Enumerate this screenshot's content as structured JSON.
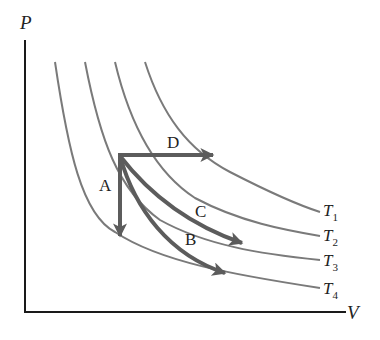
{
  "diagram": {
    "type": "PV-diagram",
    "axes": {
      "y_label": "P",
      "x_label": "V"
    },
    "isotherms": [
      {
        "label": "T",
        "sub": "1"
      },
      {
        "label": "T",
        "sub": "2"
      },
      {
        "label": "T",
        "sub": "3"
      },
      {
        "label": "T",
        "sub": "4"
      }
    ],
    "processes": [
      {
        "label": "A",
        "description": "vertical arrow down (constant volume) from start point to T4 isotherm"
      },
      {
        "label": "B",
        "description": "curved arrow from start point down-right to T4 isotherm"
      },
      {
        "label": "C",
        "description": "curved arrow from start point down-right to T3 isotherm"
      },
      {
        "label": "D",
        "description": "horizontal arrow right (constant pressure) from start point to T1 isotherm"
      }
    ],
    "colors": {
      "isotherm": "#7a7a7a",
      "arrow": "#5c5c5c",
      "axis": "#1a1a1a",
      "text": "#222222"
    }
  }
}
